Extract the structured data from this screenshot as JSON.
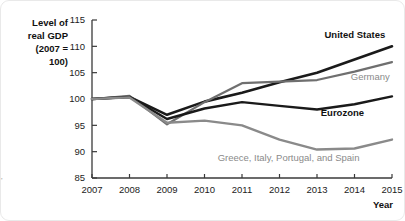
{
  "chart_data": {
    "type": "line",
    "title": "",
    "xlabel": "Year",
    "ylabel": "Level of real GDP (2007 = 100)",
    "ylabel_lines": [
      "Level of",
      "real GDP",
      "(2007 =",
      "100)"
    ],
    "x": [
      2007,
      2008,
      2009,
      2010,
      2011,
      2012,
      2013,
      2014,
      2015
    ],
    "categories": [
      "2007",
      "2008",
      "2009",
      "2010",
      "2011",
      "2012",
      "2013",
      "2014",
      "2015"
    ],
    "xlim": [
      2007,
      2015
    ],
    "ylim": [
      85,
      115
    ],
    "yticks": [
      85,
      90,
      95,
      100,
      105,
      110,
      115
    ],
    "ytick_labels": [
      "85",
      "90",
      "95",
      "100",
      "105",
      "110",
      "115"
    ],
    "grid": false,
    "legend_position": "inline-annotations",
    "series": [
      {
        "name": "United States",
        "color": "#1a1a1a",
        "width": 2.6,
        "label_style": "dark-bold",
        "values": [
          100.0,
          100.4,
          97.0,
          99.5,
          101.2,
          103.2,
          105.0,
          107.5,
          110.0
        ]
      },
      {
        "name": "Germany",
        "color": "#6f6f6f",
        "width": 2.2,
        "label_style": "gray",
        "values": [
          100.0,
          100.6,
          95.2,
          99.4,
          103.0,
          103.3,
          103.6,
          105.2,
          107.0
        ]
      },
      {
        "name": "Eurozone",
        "color": "#1a1a1a",
        "width": 2.4,
        "label_style": "dark-bold",
        "values": [
          100.0,
          100.4,
          96.2,
          98.2,
          99.4,
          98.7,
          98.0,
          99.0,
          100.5
        ]
      },
      {
        "name": "Greece, Italy, Portugal, and Spain",
        "color": "#8a8a8a",
        "width": 2.4,
        "label_style": "gray",
        "values": [
          100.0,
          100.3,
          95.5,
          95.9,
          95.0,
          92.3,
          90.4,
          90.6,
          92.3
        ]
      }
    ],
    "annotations": [
      {
        "text": "United States",
        "x": 2013.2,
        "y": 111.6,
        "style": "dark-bold"
      },
      {
        "text": "Germany",
        "x": 2013.9,
        "y": 103.6,
        "style": "gray"
      },
      {
        "text": "Eurozone",
        "x": 2013.1,
        "y": 96.7,
        "style": "dark-bold"
      },
      {
        "text": "Greece, Italy, Portugal, and Spain",
        "x": 2010.35,
        "y": 88.3,
        "style": "gray"
      }
    ]
  }
}
